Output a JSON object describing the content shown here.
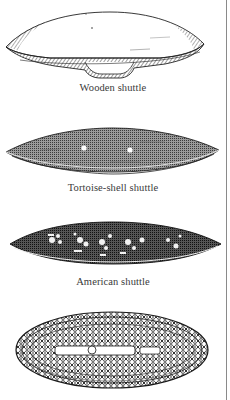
{
  "figures": [
    {
      "id": "wooden",
      "caption": "Wooden shuttle"
    },
    {
      "id": "tortoise",
      "caption": "Tortoise-shell shuttle"
    },
    {
      "id": "american",
      "caption": "American shuttle"
    },
    {
      "id": "ornate",
      "caption": ""
    }
  ],
  "colors": {
    "ink": "#1a1a1a",
    "halftone_dark": "#3c3c3c",
    "halftone_mid": "#8c8c8c",
    "paper": "#ffffff",
    "rule": "#8a8a8a"
  }
}
